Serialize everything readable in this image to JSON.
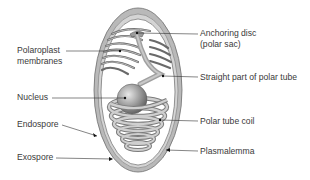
{
  "diagram": {
    "colors": {
      "exospore": "#8f8f8f",
      "endospore": "#cfcfcf",
      "membranes": "#6e6e6e",
      "polar_tube": "#a6a6a6",
      "nucleus": "#9a9a9a",
      "text": "#3a3a3a",
      "leader_line": "#333333"
    },
    "labels": {
      "polaroplast_line1": "Polaroplast",
      "polaroplast_line2": "membranes",
      "anchoring_line1": "Anchoring disc",
      "anchoring_line2": "(polar sac)",
      "straight_tube": "Straight part of polar tube",
      "nucleus": "Nucleus",
      "endospore": "Endospore",
      "polar_tube_coil": "Polar tube coil",
      "exospore": "Exospore",
      "plasmalemma": "Plasmalemma"
    }
  }
}
